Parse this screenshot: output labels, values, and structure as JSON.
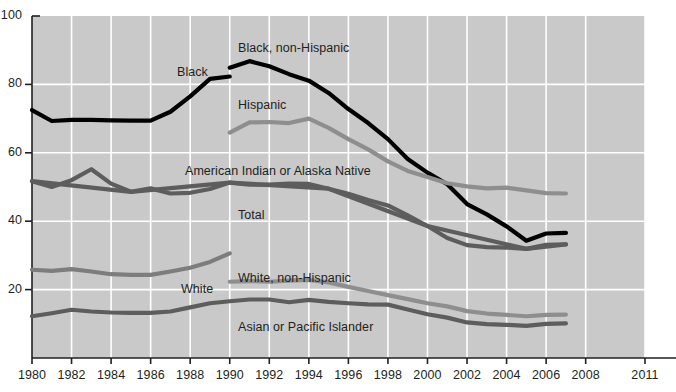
{
  "chart_data": {
    "type": "line",
    "title": "",
    "xlabel": "",
    "ylabel": "",
    "xlim": [
      1980,
      2011
    ],
    "ylim": [
      0,
      100
    ],
    "yticks": [
      20,
      40,
      60,
      80,
      100
    ],
    "xticks": [
      1980,
      1982,
      1984,
      1986,
      1988,
      1990,
      1992,
      1994,
      1996,
      1998,
      2000,
      2002,
      2004,
      2006,
      2008,
      2011
    ],
    "grid": true,
    "legend_position": "inline-labels",
    "background_color": "#c9c9c9",
    "gridline_color": "#ffffff",
    "series": [
      {
        "name": "Black",
        "label": "Black",
        "color": "#000000",
        "width": 4.2,
        "x": [
          1980,
          1981,
          1982,
          1983,
          1984,
          1985,
          1986,
          1987,
          1988,
          1989,
          1990
        ],
        "values": [
          72.5,
          69.3,
          69.6,
          69.6,
          69.5,
          69.4,
          69.4,
          72.0,
          76.5,
          81.6,
          82.3
        ]
      },
      {
        "name": "Black, non-Hispanic",
        "label": "Black, non-Hispanic",
        "color": "#000000",
        "width": 4.2,
        "x": [
          1990,
          1991,
          1992,
          1993,
          1994,
          1995,
          1996,
          1997,
          1998,
          1999,
          2000,
          2001,
          2002,
          2003,
          2004,
          2005,
          2006,
          2007
        ],
        "values": [
          84.9,
          86.8,
          85.3,
          83.0,
          81.1,
          77.5,
          72.8,
          68.7,
          64.0,
          58.2,
          54.2,
          50.8,
          45.0,
          42.0,
          38.5,
          34.3,
          36.4,
          36.6
        ]
      },
      {
        "name": "Hispanic",
        "label": "Hispanic",
        "color": "#8e8e8e",
        "width": 4.2,
        "x": [
          1990,
          1991,
          1992,
          1993,
          1994,
          1995,
          1996,
          1997,
          1998,
          1999,
          2000,
          2001,
          2002,
          2003,
          2004,
          2005,
          2006,
          2007
        ],
        "values": [
          65.9,
          68.9,
          69.0,
          68.7,
          70.0,
          67.3,
          64.0,
          61.0,
          57.5,
          54.7,
          52.9,
          51.1,
          50.2,
          49.6,
          49.8,
          49.0,
          48.2,
          48.1
        ]
      },
      {
        "name": "American Indian or Alaska Native",
        "label": "American Indian or Alaska Native",
        "color": "#5d5d5d",
        "width": 4.2,
        "x": [
          1980,
          1981,
          1982,
          1983,
          1984,
          1985,
          1986,
          1987,
          1988,
          1989,
          1990,
          1991,
          1992,
          1993,
          1994,
          1995,
          1996,
          1997,
          1998,
          1999,
          2000,
          2001,
          2002,
          2003,
          2004,
          2005,
          2006,
          2007
        ],
        "values": [
          51.7,
          50.0,
          52.0,
          55.2,
          51.0,
          48.6,
          49.6,
          48.1,
          48.3,
          49.4,
          51.3,
          50.7,
          50.7,
          51.0,
          50.9,
          49.5,
          48.0,
          46.2,
          44.6,
          41.7,
          38.6,
          35.1,
          33.0,
          32.4,
          32.3,
          31.9,
          33.1,
          33.2
        ]
      },
      {
        "name": "Total",
        "label": "Total",
        "color": "#5d5d5d",
        "width": 4.2,
        "x": [
          1980,
          1985,
          1990,
          1995,
          2000,
          2005,
          2007
        ],
        "values": [
          51.7,
          48.6,
          51.3,
          49.5,
          38.6,
          31.9,
          33.2
        ]
      },
      {
        "name": "White",
        "label": "White",
        "color": "#7d7d7d",
        "width": 4.2,
        "x": [
          1980,
          1981,
          1982,
          1983,
          1984,
          1985,
          1986,
          1987,
          1988,
          1989,
          1990
        ],
        "values": [
          25.8,
          25.5,
          26.0,
          25.3,
          24.5,
          24.3,
          24.3,
          25.3,
          26.4,
          28.1,
          30.6
        ]
      },
      {
        "name": "White, non-Hispanic",
        "label": "White, non-Hispanic",
        "color": "#8e8e8e",
        "width": 4.2,
        "x": [
          1990,
          1991,
          1992,
          1993,
          1994,
          1995,
          1996,
          1997,
          1998,
          1999,
          2000,
          2001,
          2002,
          2003,
          2004,
          2005,
          2006,
          2007
        ],
        "values": [
          22.3,
          22.5,
          22.3,
          22.6,
          22.8,
          22.1,
          20.8,
          19.6,
          18.4,
          17.2,
          16.0,
          15.1,
          13.7,
          13.0,
          12.6,
          12.2,
          12.6,
          12.7
        ]
      },
      {
        "name": "Asian or Pacific Islander",
        "label": "Asian or Pacific Islander",
        "color": "#5d5d5d",
        "width": 4.2,
        "x": [
          1980,
          1981,
          1982,
          1983,
          1984,
          1985,
          1986,
          1987,
          1988,
          1989,
          1990,
          1991,
          1992,
          1993,
          1994,
          1995,
          1996,
          1997,
          1998,
          1999,
          2000,
          2001,
          2002,
          2003,
          2004,
          2005,
          2006,
          2007
        ],
        "values": [
          12.2,
          13.1,
          14.1,
          13.6,
          13.3,
          13.2,
          13.2,
          13.6,
          14.8,
          16.0,
          16.6,
          17.1,
          17.1,
          16.3,
          17.0,
          16.4,
          16.0,
          15.7,
          15.6,
          14.2,
          12.8,
          11.8,
          10.4,
          9.9,
          9.7,
          9.4,
          10.0,
          10.1
        ]
      }
    ],
    "inline_labels": [
      {
        "text": "Black, non-Hispanic",
        "x": 238,
        "y": 41
      },
      {
        "text": "Black",
        "x": 177,
        "y": 65
      },
      {
        "text": "Hispanic",
        "x": 238,
        "y": 98
      },
      {
        "text": "American Indian or Alaska Native",
        "x": 185,
        "y": 164
      },
      {
        "text": "Total",
        "x": 238,
        "y": 208
      },
      {
        "text": "White, non-Hispanic",
        "x": 238,
        "y": 271
      },
      {
        "text": "White",
        "x": 181,
        "y": 282
      },
      {
        "text": "Asian or Pacific Islander",
        "x": 238,
        "y": 320
      }
    ]
  }
}
